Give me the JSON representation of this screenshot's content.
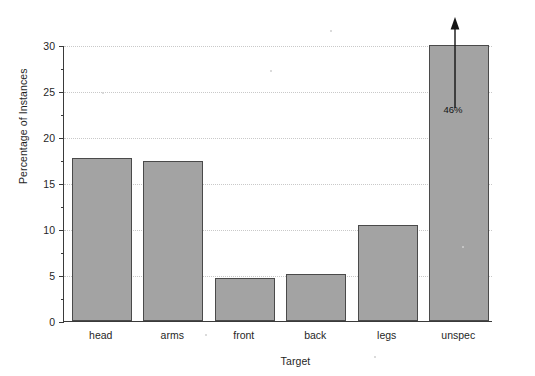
{
  "chart_data": {
    "type": "bar",
    "title": "",
    "xlabel": "Target",
    "ylabel": "Percentage of Instances",
    "categories": [
      "head",
      "arms",
      "front",
      "back",
      "legs",
      "unspec"
    ],
    "values": [
      17.7,
      17.4,
      4.7,
      5.1,
      10.4,
      30.0
    ],
    "ylim": [
      0,
      30
    ],
    "yticks": [
      0,
      5,
      10,
      15,
      20,
      25,
      30
    ],
    "ytick_labels": [
      "0",
      "5",
      "10",
      "15",
      "20",
      "25",
      "30"
    ],
    "grid": true,
    "grid_axis": "y",
    "legend": false,
    "legend_position": "none",
    "bar_fill_color": "#a3a3a3",
    "bar_edge_color": "#4a4a4a",
    "axis_color": "#3a3a3a",
    "grid_color": "#c9c9c9",
    "annotations": [
      {
        "name": "truncated-bar-arrow",
        "category": "unspec",
        "label": "46%",
        "note": "bar clipped at axis maximum of 30; upward arrow indicates true value",
        "true_value": 46
      }
    ]
  },
  "axes": {
    "y_title": "Percentage of Instances",
    "x_title": "Target"
  },
  "ticks": {
    "y": [
      {
        "value": 30,
        "label": "30"
      },
      {
        "value": 25,
        "label": "25"
      },
      {
        "value": 20,
        "label": "20"
      },
      {
        "value": 15,
        "label": "15"
      },
      {
        "value": 10,
        "label": "10"
      },
      {
        "value": 5,
        "label": "5"
      },
      {
        "value": 0,
        "label": "0"
      }
    ]
  },
  "bars": [
    {
      "label": "head",
      "value": 17.7
    },
    {
      "label": "arms",
      "value": 17.4
    },
    {
      "label": "front",
      "value": 4.7
    },
    {
      "label": "back",
      "value": 5.1
    },
    {
      "label": "legs",
      "value": 10.4
    },
    {
      "label": "unspec",
      "value": 30.0
    }
  ],
  "annotation": {
    "arrow_label": "46%"
  }
}
